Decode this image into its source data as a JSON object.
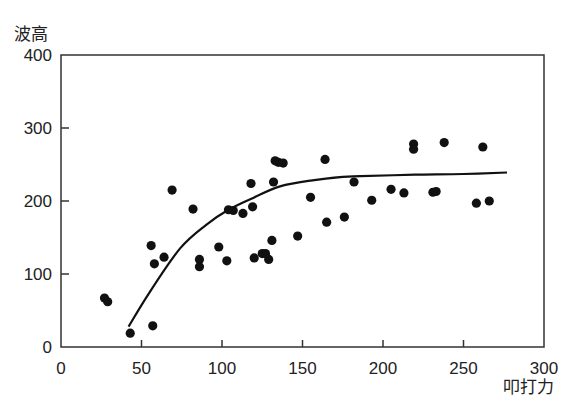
{
  "chart_data": {
    "type": "scatter",
    "title": "",
    "xlabel": "叩打力",
    "ylabel": "波高",
    "xlim": [
      0,
      300
    ],
    "ylim": [
      0,
      400
    ],
    "xticks": [
      0,
      50,
      100,
      150,
      200,
      250,
      300
    ],
    "yticks": [
      0,
      100,
      200,
      300,
      400
    ],
    "grid": false,
    "legend": null,
    "series": [
      {
        "name": "measurements",
        "kind": "scatter",
        "points": [
          [
            27,
            67
          ],
          [
            29,
            62
          ],
          [
            43,
            19
          ],
          [
            57,
            29
          ],
          [
            56,
            139
          ],
          [
            58,
            114
          ],
          [
            64,
            123
          ],
          [
            69,
            215
          ],
          [
            82,
            189
          ],
          [
            86,
            120
          ],
          [
            86,
            110
          ],
          [
            98,
            137
          ],
          [
            103,
            118
          ],
          [
            104,
            188
          ],
          [
            107,
            187
          ],
          [
            113,
            183
          ],
          [
            118,
            224
          ],
          [
            119,
            192
          ],
          [
            120,
            122
          ],
          [
            125,
            128
          ],
          [
            127,
            128
          ],
          [
            129,
            120
          ],
          [
            131,
            146
          ],
          [
            132,
            226
          ],
          [
            133,
            255
          ],
          [
            135,
            253
          ],
          [
            138,
            252
          ],
          [
            147,
            152
          ],
          [
            155,
            205
          ],
          [
            164,
            257
          ],
          [
            165,
            171
          ],
          [
            176,
            178
          ],
          [
            182,
            226
          ],
          [
            193,
            201
          ],
          [
            205,
            216
          ],
          [
            213,
            211
          ],
          [
            219,
            278
          ],
          [
            219,
            271
          ],
          [
            231,
            212
          ],
          [
            233,
            213
          ],
          [
            238,
            280
          ],
          [
            258,
            197
          ],
          [
            262,
            274
          ],
          [
            266,
            200
          ]
        ]
      },
      {
        "name": "fitted curve",
        "kind": "line",
        "points": [
          [
            42,
            28
          ],
          [
            55,
            75
          ],
          [
            74,
            135
          ],
          [
            90,
            167
          ],
          [
            104,
            188
          ],
          [
            120,
            205
          ],
          [
            136,
            220
          ],
          [
            155,
            228
          ],
          [
            175,
            233
          ],
          [
            186,
            234
          ],
          [
            220,
            236
          ],
          [
            250,
            237
          ],
          [
            277,
            239
          ]
        ]
      }
    ]
  }
}
